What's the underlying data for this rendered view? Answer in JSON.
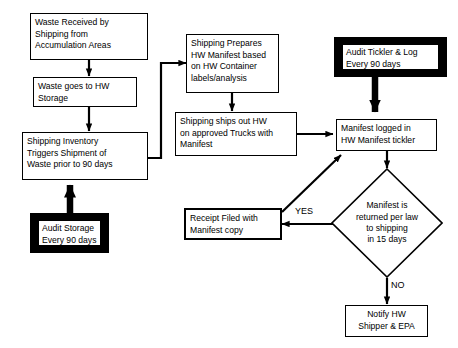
{
  "diagram": {
    "colors": {
      "background": "#ffffff",
      "stroke": "#000000",
      "audit_fill": "#000000",
      "node_fill": "#ffffff"
    },
    "nodes": [
      {
        "id": "waste-received",
        "shape": "rectangle",
        "lines": [
          "Waste Received by",
          "Shipping from",
          "Accumulation Areas"
        ]
      },
      {
        "id": "waste-storage",
        "shape": "rectangle",
        "lines": [
          "Waste goes to HW",
          "Storage"
        ]
      },
      {
        "id": "shipping-inventory",
        "shape": "rectangle",
        "lines": [
          "Shipping Inventory",
          "Triggers Shipment of",
          "Waste prior to 90 days"
        ]
      },
      {
        "id": "audit-storage",
        "shape": "rectangle-heavy",
        "lines": [
          "Audit Storage",
          "Every 90 days"
        ]
      },
      {
        "id": "shipping-prepares",
        "shape": "rectangle",
        "lines": [
          "Shipping Prepares",
          "HW Manifest based",
          "on HW Container",
          "labels/analysis"
        ]
      },
      {
        "id": "shipping-ships-out",
        "shape": "rectangle",
        "lines": [
          "Shipping ships out HW",
          "on approved Trucks with",
          "Manifest"
        ]
      },
      {
        "id": "receipt-filed",
        "shape": "rectangle",
        "lines": [
          "Receipt Filed with",
          "Manifest copy"
        ]
      },
      {
        "id": "audit-tickler",
        "shape": "rectangle-heavy",
        "lines": [
          "Audit Tickler  & Log",
          "Every 90 days"
        ]
      },
      {
        "id": "manifest-logged",
        "shape": "rectangle",
        "lines": [
          "Manifest logged in",
          "HW Manifest tickler"
        ]
      },
      {
        "id": "manifest-returned",
        "shape": "diamond",
        "lines": [
          "Manifest is",
          "returned  per law",
          "to shipping",
          "in 15 days"
        ]
      },
      {
        "id": "notify-hw",
        "shape": "rectangle",
        "lines": [
          "Notify HW",
          "Shipper & EPA"
        ]
      }
    ],
    "edge_labels": {
      "yes": "YES",
      "no": "NO"
    },
    "edges": [
      {
        "from": "waste-received",
        "to": "waste-storage",
        "label": ""
      },
      {
        "from": "waste-storage",
        "to": "shipping-inventory",
        "label": ""
      },
      {
        "from": "audit-storage",
        "to": "shipping-inventory",
        "label": ""
      },
      {
        "from": "shipping-inventory",
        "to": "shipping-prepares",
        "label": ""
      },
      {
        "from": "shipping-prepares",
        "to": "shipping-ships-out",
        "label": ""
      },
      {
        "from": "shipping-ships-out",
        "to": "manifest-logged",
        "label": ""
      },
      {
        "from": "audit-tickler",
        "to": "manifest-logged",
        "label": ""
      },
      {
        "from": "manifest-logged",
        "to": "manifest-returned",
        "label": ""
      },
      {
        "from": "manifest-returned",
        "to": "receipt-filed",
        "label": "YES"
      },
      {
        "from": "manifest-returned",
        "to": "notify-hw",
        "label": "NO"
      },
      {
        "from": "receipt-filed",
        "to": "manifest-logged",
        "label": ""
      }
    ]
  }
}
